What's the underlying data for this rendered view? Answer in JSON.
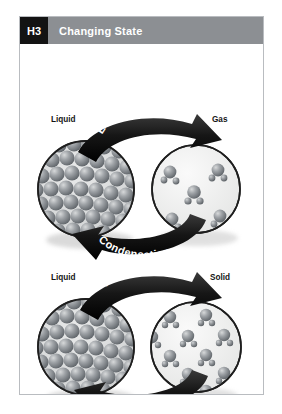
{
  "header": {
    "tag": "H3",
    "title": "Changing State"
  },
  "figure": {
    "name": "changing-state-diagram",
    "diagrams": [
      {
        "id": "liquid-gas",
        "left_state": "Liquid",
        "right_state": "Gas",
        "forward_process": "Evaporation",
        "reverse_process": "Condensation",
        "left_particles": "dense-packed-spheres",
        "right_particles": "sparse-molecules",
        "right_particle_count": 5
      },
      {
        "id": "liquid-solid",
        "left_state": "Liquid",
        "right_state": "Solid",
        "forward_process": "Freezing",
        "reverse_process": "Melting",
        "left_particles": "dense-packed-spheres",
        "right_particles": "hexagonal-lattice",
        "right_particle_count": 13
      }
    ]
  },
  "colors": {
    "tag_background": "#131313",
    "header_background": "#8c8f93",
    "header_text": "#ffffff",
    "card_border": "#b9bcc0",
    "page_background": "#ffffff",
    "arrow_fill": "#1b1b1b",
    "arrow_text": "#ffffff",
    "particle_fill": "#8e9196",
    "circle_fill": "#f2f2f0",
    "circle_stroke": "#2a2a2a",
    "label_text": "#141414"
  }
}
